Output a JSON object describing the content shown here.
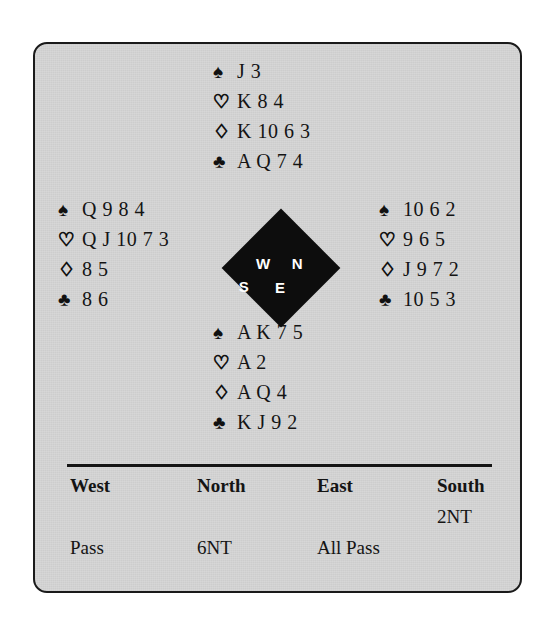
{
  "deal": {
    "suit_symbols": {
      "spades": "♠",
      "hearts": "♡",
      "diamonds": "♢",
      "clubs": "♣"
    },
    "hands": {
      "north": {
        "label": "North",
        "spades": "J 3",
        "hearts": "K 8 4",
        "diamonds": "K 10 6 3",
        "clubs": "A Q 7 4"
      },
      "west": {
        "label": "West",
        "spades": "Q 9 8 4",
        "hearts": "Q J 10 7 3",
        "diamonds": "8 5",
        "clubs": "8 6"
      },
      "east": {
        "label": "East",
        "spades": "10 6 2",
        "hearts": "9 6 5",
        "diamonds": "J 9 7 2",
        "clubs": "10 5 3"
      },
      "south": {
        "label": "South",
        "spades": "A K 7 5",
        "hearts": "A 2",
        "diamonds": "A Q 4",
        "clubs": "K J 9 2"
      }
    },
    "compass": {
      "north": "N",
      "west": "W",
      "east": "E",
      "south": "S"
    }
  },
  "auction": {
    "headers": {
      "west": "West",
      "north": "North",
      "east": "East",
      "south": "South"
    },
    "rows": [
      {
        "west": "",
        "north": "",
        "east": "",
        "south": "2NT"
      },
      {
        "west": "Pass",
        "north": "6NT",
        "east": "All Pass",
        "south": ""
      }
    ]
  }
}
